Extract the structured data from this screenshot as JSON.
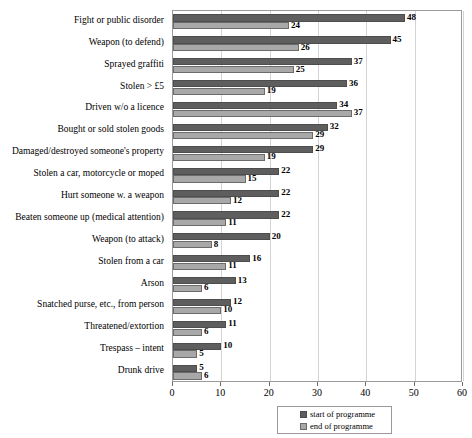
{
  "chart_data": {
    "type": "bar",
    "orientation": "horizontal",
    "title": "",
    "xlabel": "",
    "ylabel": "",
    "xlim": [
      0,
      60
    ],
    "xticks": [
      0,
      10,
      20,
      30,
      40,
      50,
      60
    ],
    "grid": true,
    "legend_position": "bottom",
    "categories": [
      "Fight or public disorder",
      "Weapon (to defend)",
      "Sprayed graffiti",
      "Stolen > £5",
      "Driven w/o a licence",
      "Bought or sold stolen goods",
      "Damaged/destroyed someone's property",
      "Stolen a car, motorcycle or moped",
      "Hurt someone w. a weapon",
      "Beaten someone up (medical attention)",
      "Weapon (to attack)",
      "Stolen from a car",
      "Arson",
      "Snatched purse, etc., from person",
      "Threatened/extortion",
      "Trespass – intent",
      "Drunk drive"
    ],
    "series": [
      {
        "name": "start of programme",
        "color": "#5e5e5e",
        "values": [
          48,
          45,
          37,
          36,
          34,
          32,
          29,
          22,
          22,
          22,
          20,
          16,
          13,
          12,
          11,
          10,
          5
        ]
      },
      {
        "name": "end of programme",
        "color": "#a8a8a8",
        "values": [
          24,
          26,
          25,
          19,
          37,
          29,
          19,
          15,
          12,
          11,
          8,
          11,
          6,
          10,
          6,
          5,
          6
        ]
      }
    ]
  },
  "legend": {
    "items": [
      {
        "label": "start of programme"
      },
      {
        "label": "end of programme"
      }
    ]
  },
  "axis": {
    "tick_labels": [
      "0",
      "10",
      "20",
      "30",
      "40",
      "50",
      "60"
    ]
  },
  "colors": {
    "start": "#5e5e5e",
    "end": "#a8a8a8",
    "frame": "#9b9b9b",
    "grid": "#d3d3d3"
  }
}
